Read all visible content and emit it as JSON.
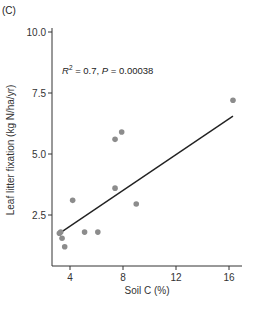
{
  "panel_label": "(C)",
  "chart_data": {
    "type": "scatter",
    "title": "",
    "xlabel": "Soil C (%)",
    "ylabel": "Leaf litter fixation (kg N/ha/yr)",
    "xlim": [
      2.6,
      17.3
    ],
    "ylim": [
      0.4,
      10.2
    ],
    "xticks": [
      4,
      8,
      12,
      16
    ],
    "xtick_labels": [
      "4",
      "8",
      "12",
      "16"
    ],
    "yticks": [
      2.5,
      5.0,
      7.5,
      10.0
    ],
    "ytick_labels": [
      "2.5",
      "5.0",
      "7.5",
      "10.0"
    ],
    "grid": false,
    "annotation": {
      "r2_label": "R",
      "r2_sup": "2",
      "r2_value": " = 0.7, ",
      "p_label": "P",
      "p_value": " = 0.00038"
    },
    "points": [
      {
        "x": 3.2,
        "y": 1.75
      },
      {
        "x": 3.3,
        "y": 1.8
      },
      {
        "x": 3.4,
        "y": 1.55
      },
      {
        "x": 3.6,
        "y": 1.2
      },
      {
        "x": 4.2,
        "y": 3.1
      },
      {
        "x": 5.1,
        "y": 1.8
      },
      {
        "x": 6.1,
        "y": 1.8
      },
      {
        "x": 7.4,
        "y": 3.6
      },
      {
        "x": 7.4,
        "y": 5.6
      },
      {
        "x": 7.9,
        "y": 5.9
      },
      {
        "x": 9.0,
        "y": 2.95
      },
      {
        "x": 16.3,
        "y": 7.2
      }
    ],
    "regression_line": {
      "x": [
        3.2,
        16.3
      ],
      "y": [
        1.75,
        6.55
      ]
    },
    "point_color": "#8c8c8c",
    "line_color": "#222222"
  }
}
